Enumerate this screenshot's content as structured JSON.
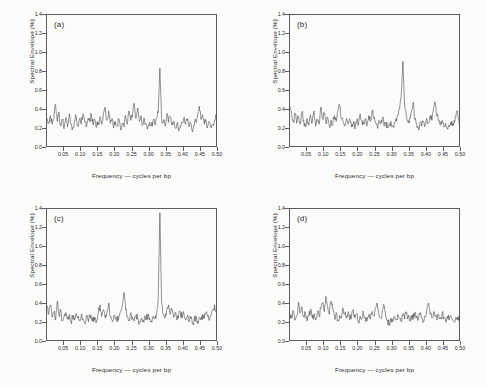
{
  "figure": {
    "background_color": "#fbfbfa",
    "line_color": "#3a3a3a",
    "axis_color": "#5d5d5d"
  },
  "axes": {
    "xlabel": "Frequency — cycles per bp",
    "ylabel": "Spectral Envelope (%)",
    "xticks": [
      "0.05",
      "0.10",
      "0.15",
      "0.20",
      "0.25",
      "0.30",
      "0.35",
      "0.40",
      "0.45",
      "0.50"
    ],
    "xtick_values": [
      0.05,
      0.1,
      0.15,
      0.2,
      0.25,
      0.3,
      0.35,
      0.4,
      0.45,
      0.5
    ],
    "yticks": [
      "0.0",
      "0.2",
      "0.4",
      "0.6",
      "0.8",
      "1.0",
      "1.2",
      "1.4"
    ],
    "ytick_values": [
      0.0,
      0.2,
      0.4,
      0.6,
      0.8,
      1.0,
      1.2,
      1.4
    ],
    "xlim": [
      0.0,
      0.5
    ],
    "ylim": [
      0.0,
      1.4
    ],
    "grid": false
  },
  "panels": [
    {
      "tag": "(a)"
    },
    {
      "tag": "(b)"
    },
    {
      "tag": "(c)"
    },
    {
      "tag": "(d)"
    }
  ],
  "chart_data": [
    {
      "type": "line",
      "title": "(a)",
      "xlabel": "Frequency — cycles per bp",
      "ylabel": "Spectral Envelope (%)",
      "xlim": [
        0.0,
        0.5
      ],
      "ylim": [
        0.0,
        1.4
      ],
      "grid": false,
      "legend": null,
      "peak_frequency": 0.333,
      "peak_value": 0.83,
      "x": [
        0.003,
        0.008,
        0.013,
        0.018,
        0.023,
        0.028,
        0.033,
        0.038,
        0.043,
        0.048,
        0.053,
        0.058,
        0.063,
        0.068,
        0.073,
        0.078,
        0.083,
        0.088,
        0.093,
        0.098,
        0.103,
        0.108,
        0.113,
        0.118,
        0.123,
        0.128,
        0.133,
        0.138,
        0.143,
        0.148,
        0.153,
        0.158,
        0.163,
        0.168,
        0.173,
        0.178,
        0.183,
        0.188,
        0.193,
        0.198,
        0.203,
        0.208,
        0.213,
        0.218,
        0.223,
        0.228,
        0.233,
        0.238,
        0.243,
        0.248,
        0.253,
        0.258,
        0.263,
        0.268,
        0.273,
        0.278,
        0.283,
        0.288,
        0.293,
        0.298,
        0.303,
        0.308,
        0.313,
        0.318,
        0.323,
        0.328,
        0.333,
        0.338,
        0.343,
        0.348,
        0.353,
        0.358,
        0.363,
        0.368,
        0.373,
        0.378,
        0.383,
        0.388,
        0.393,
        0.398,
        0.403,
        0.408,
        0.413,
        0.418,
        0.423,
        0.428,
        0.433,
        0.438,
        0.443,
        0.448,
        0.453,
        0.458,
        0.463,
        0.468,
        0.473,
        0.478,
        0.483,
        0.488,
        0.493,
        0.498
      ],
      "values": [
        0.3,
        0.26,
        0.33,
        0.24,
        0.3,
        0.45,
        0.27,
        0.37,
        0.22,
        0.29,
        0.19,
        0.31,
        0.21,
        0.35,
        0.24,
        0.2,
        0.27,
        0.33,
        0.22,
        0.3,
        0.24,
        0.35,
        0.26,
        0.21,
        0.3,
        0.27,
        0.34,
        0.23,
        0.28,
        0.21,
        0.26,
        0.32,
        0.24,
        0.36,
        0.42,
        0.28,
        0.38,
        0.25,
        0.3,
        0.2,
        0.27,
        0.22,
        0.3,
        0.18,
        0.25,
        0.21,
        0.33,
        0.24,
        0.38,
        0.28,
        0.33,
        0.46,
        0.3,
        0.41,
        0.27,
        0.33,
        0.23,
        0.29,
        0.24,
        0.21,
        0.26,
        0.22,
        0.28,
        0.24,
        0.3,
        0.36,
        0.83,
        0.3,
        0.26,
        0.22,
        0.34,
        0.26,
        0.32,
        0.23,
        0.27,
        0.2,
        0.25,
        0.17,
        0.22,
        0.26,
        0.31,
        0.24,
        0.28,
        0.21,
        0.25,
        0.16,
        0.22,
        0.27,
        0.33,
        0.43,
        0.29,
        0.34,
        0.24,
        0.28,
        0.22,
        0.26,
        0.2,
        0.24,
        0.28,
        0.32
      ]
    },
    {
      "type": "line",
      "title": "(b)",
      "xlabel": "Frequency — cycles per bp",
      "ylabel": "Spectral Envelope (%)",
      "xlim": [
        0.0,
        0.5
      ],
      "ylim": [
        0.0,
        1.4
      ],
      "grid": false,
      "legend": null,
      "peak_frequency": 0.333,
      "peak_value": 0.9,
      "x": [
        0.003,
        0.008,
        0.013,
        0.018,
        0.023,
        0.028,
        0.033,
        0.038,
        0.043,
        0.048,
        0.053,
        0.058,
        0.063,
        0.068,
        0.073,
        0.078,
        0.083,
        0.088,
        0.093,
        0.098,
        0.103,
        0.108,
        0.113,
        0.118,
        0.123,
        0.128,
        0.133,
        0.138,
        0.143,
        0.148,
        0.153,
        0.158,
        0.163,
        0.168,
        0.173,
        0.178,
        0.183,
        0.188,
        0.193,
        0.198,
        0.203,
        0.208,
        0.213,
        0.218,
        0.223,
        0.228,
        0.233,
        0.238,
        0.243,
        0.248,
        0.253,
        0.258,
        0.263,
        0.268,
        0.273,
        0.278,
        0.283,
        0.288,
        0.293,
        0.298,
        0.303,
        0.308,
        0.313,
        0.318,
        0.323,
        0.328,
        0.333,
        0.338,
        0.343,
        0.348,
        0.353,
        0.358,
        0.363,
        0.368,
        0.373,
        0.378,
        0.383,
        0.388,
        0.393,
        0.398,
        0.403,
        0.408,
        0.413,
        0.418,
        0.423,
        0.428,
        0.433,
        0.438,
        0.443,
        0.448,
        0.453,
        0.458,
        0.463,
        0.468,
        0.473,
        0.478,
        0.483,
        0.488,
        0.493,
        0.498
      ],
      "values": [
        0.42,
        0.33,
        0.27,
        0.35,
        0.25,
        0.31,
        0.24,
        0.37,
        0.28,
        0.21,
        0.3,
        0.23,
        0.34,
        0.26,
        0.38,
        0.22,
        0.29,
        0.24,
        0.42,
        0.3,
        0.35,
        0.25,
        0.31,
        0.22,
        0.28,
        0.24,
        0.33,
        0.27,
        0.38,
        0.44,
        0.3,
        0.26,
        0.22,
        0.3,
        0.24,
        0.29,
        0.21,
        0.25,
        0.19,
        0.27,
        0.23,
        0.35,
        0.28,
        0.24,
        0.3,
        0.22,
        0.33,
        0.27,
        0.38,
        0.3,
        0.25,
        0.21,
        0.28,
        0.24,
        0.3,
        0.22,
        0.26,
        0.2,
        0.24,
        0.27,
        0.22,
        0.26,
        0.3,
        0.34,
        0.4,
        0.52,
        0.9,
        0.44,
        0.33,
        0.26,
        0.31,
        0.38,
        0.47,
        0.29,
        0.24,
        0.2,
        0.26,
        0.22,
        0.27,
        0.23,
        0.3,
        0.25,
        0.33,
        0.28,
        0.41,
        0.45,
        0.33,
        0.27,
        0.23,
        0.28,
        0.21,
        0.25,
        0.19,
        0.23,
        0.26,
        0.22,
        0.28,
        0.32,
        0.38,
        0.24
      ]
    },
    {
      "type": "line",
      "title": "(c)",
      "xlabel": "Frequency — cycles per bp",
      "ylabel": "Spectral Envelope (%)",
      "xlim": [
        0.0,
        0.5
      ],
      "ylim": [
        0.0,
        1.4
      ],
      "grid": false,
      "legend": null,
      "peak_frequency": 0.333,
      "peak_value": 1.35,
      "x": [
        0.003,
        0.008,
        0.013,
        0.018,
        0.023,
        0.028,
        0.033,
        0.038,
        0.043,
        0.048,
        0.053,
        0.058,
        0.063,
        0.068,
        0.073,
        0.078,
        0.083,
        0.088,
        0.093,
        0.098,
        0.103,
        0.108,
        0.113,
        0.118,
        0.123,
        0.128,
        0.133,
        0.138,
        0.143,
        0.148,
        0.153,
        0.158,
        0.163,
        0.168,
        0.173,
        0.178,
        0.183,
        0.188,
        0.193,
        0.198,
        0.203,
        0.208,
        0.213,
        0.218,
        0.223,
        0.228,
        0.233,
        0.238,
        0.243,
        0.248,
        0.253,
        0.258,
        0.263,
        0.268,
        0.273,
        0.278,
        0.283,
        0.288,
        0.293,
        0.298,
        0.303,
        0.308,
        0.313,
        0.318,
        0.323,
        0.328,
        0.333,
        0.338,
        0.343,
        0.348,
        0.353,
        0.358,
        0.363,
        0.368,
        0.373,
        0.378,
        0.383,
        0.388,
        0.393,
        0.398,
        0.403,
        0.408,
        0.413,
        0.418,
        0.423,
        0.428,
        0.433,
        0.438,
        0.443,
        0.448,
        0.453,
        0.458,
        0.463,
        0.468,
        0.473,
        0.478,
        0.483,
        0.488,
        0.493,
        0.498
      ],
      "values": [
        0.36,
        0.28,
        0.38,
        0.25,
        0.3,
        0.22,
        0.42,
        0.27,
        0.33,
        0.21,
        0.26,
        0.3,
        0.23,
        0.28,
        0.2,
        0.25,
        0.22,
        0.29,
        0.24,
        0.21,
        0.27,
        0.23,
        0.19,
        0.26,
        0.22,
        0.28,
        0.24,
        0.2,
        0.25,
        0.21,
        0.3,
        0.38,
        0.26,
        0.33,
        0.24,
        0.29,
        0.4,
        0.26,
        0.22,
        0.27,
        0.23,
        0.2,
        0.26,
        0.31,
        0.37,
        0.51,
        0.33,
        0.26,
        0.22,
        0.3,
        0.25,
        0.21,
        0.27,
        0.23,
        0.19,
        0.24,
        0.2,
        0.26,
        0.22,
        0.28,
        0.24,
        0.21,
        0.26,
        0.23,
        0.28,
        0.45,
        1.35,
        0.4,
        0.28,
        0.24,
        0.33,
        0.38,
        0.28,
        0.33,
        0.25,
        0.3,
        0.22,
        0.27,
        0.31,
        0.24,
        0.29,
        0.22,
        0.26,
        0.2,
        0.24,
        0.18,
        0.22,
        0.26,
        0.21,
        0.25,
        0.22,
        0.28,
        0.24,
        0.3,
        0.26,
        0.22,
        0.28,
        0.33,
        0.38,
        0.3
      ]
    },
    {
      "type": "line",
      "title": "(d)",
      "xlabel": "Frequency — cycles per bp",
      "ylabel": "Spectral Envelope (%)",
      "xlim": [
        0.0,
        0.5
      ],
      "ylim": [
        0.0,
        1.4
      ],
      "grid": false,
      "legend": null,
      "peak_frequency": 0.092,
      "peak_value": 0.47,
      "x": [
        0.003,
        0.008,
        0.013,
        0.018,
        0.023,
        0.028,
        0.033,
        0.038,
        0.043,
        0.048,
        0.053,
        0.058,
        0.063,
        0.068,
        0.073,
        0.078,
        0.083,
        0.088,
        0.093,
        0.098,
        0.103,
        0.108,
        0.113,
        0.118,
        0.123,
        0.128,
        0.133,
        0.138,
        0.143,
        0.148,
        0.153,
        0.158,
        0.163,
        0.168,
        0.173,
        0.178,
        0.183,
        0.188,
        0.193,
        0.198,
        0.203,
        0.208,
        0.213,
        0.218,
        0.223,
        0.228,
        0.233,
        0.238,
        0.243,
        0.248,
        0.253,
        0.258,
        0.263,
        0.268,
        0.273,
        0.278,
        0.283,
        0.288,
        0.293,
        0.298,
        0.303,
        0.308,
        0.313,
        0.318,
        0.323,
        0.328,
        0.333,
        0.338,
        0.343,
        0.348,
        0.353,
        0.358,
        0.363,
        0.368,
        0.373,
        0.378,
        0.383,
        0.388,
        0.393,
        0.398,
        0.403,
        0.408,
        0.413,
        0.418,
        0.423,
        0.428,
        0.433,
        0.438,
        0.443,
        0.448,
        0.453,
        0.458,
        0.463,
        0.468,
        0.473,
        0.478,
        0.483,
        0.488,
        0.493,
        0.498
      ],
      "values": [
        0.28,
        0.24,
        0.31,
        0.22,
        0.27,
        0.41,
        0.3,
        0.36,
        0.25,
        0.29,
        0.21,
        0.26,
        0.33,
        0.24,
        0.28,
        0.22,
        0.3,
        0.26,
        0.34,
        0.4,
        0.31,
        0.47,
        0.36,
        0.28,
        0.42,
        0.33,
        0.25,
        0.3,
        0.22,
        0.27,
        0.24,
        0.35,
        0.28,
        0.24,
        0.31,
        0.22,
        0.27,
        0.33,
        0.24,
        0.29,
        0.21,
        0.26,
        0.23,
        0.3,
        0.25,
        0.21,
        0.27,
        0.23,
        0.31,
        0.26,
        0.35,
        0.4,
        0.28,
        0.24,
        0.32,
        0.38,
        0.26,
        0.22,
        0.18,
        0.24,
        0.2,
        0.26,
        0.22,
        0.28,
        0.24,
        0.2,
        0.27,
        0.23,
        0.29,
        0.25,
        0.21,
        0.27,
        0.23,
        0.3,
        0.26,
        0.22,
        0.28,
        0.24,
        0.2,
        0.26,
        0.33,
        0.4,
        0.28,
        0.24,
        0.31,
        0.26,
        0.22,
        0.27,
        0.23,
        0.29,
        0.25,
        0.21,
        0.26,
        0.22,
        0.27,
        0.23,
        0.2,
        0.25,
        0.22,
        0.26
      ]
    }
  ]
}
